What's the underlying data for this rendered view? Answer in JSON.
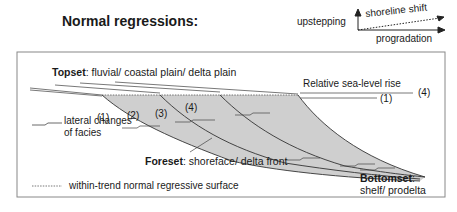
{
  "title": "Normal regressions:",
  "legend_top": {
    "upstepping": "upstepping",
    "shoreline_shift": "shoreline shift",
    "progradation": "progradation"
  },
  "diagram": {
    "topset": {
      "bold": "Topset",
      "rest": ": fluvial/ coastal plain/ delta plain"
    },
    "foreset": {
      "bold": "Foreset",
      "rest": ": shoreface/ delta front"
    },
    "bottomset": {
      "bold": "Bottomset",
      "rest": ":",
      "line2": "shelf/ prodelta"
    },
    "sea_level_label": "Relative sea-level rise",
    "sea_level_markers": [
      "(4)",
      "(1)"
    ],
    "unit_labels": [
      "(1)",
      "(2)",
      "(3)",
      "(4)"
    ],
    "legend_facies": [
      "lateral changes",
      "of facies"
    ],
    "legend_surface": "within-trend normal regressive surface"
  },
  "colors": {
    "fill": "#cfcfcf",
    "line": "#3a3a3a",
    "box": "#888888"
  }
}
